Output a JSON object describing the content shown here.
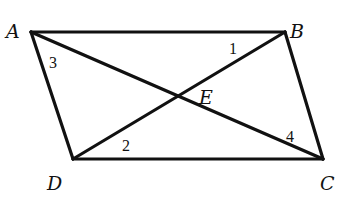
{
  "diagram": {
    "type": "parallelogram-with-diagonals",
    "stroke_color": "#111111",
    "background": "#ffffff",
    "vertices": {
      "A": {
        "label": "A",
        "x": 31,
        "y": 32,
        "label_x": 6,
        "label_y": 38
      },
      "B": {
        "label": "B",
        "x": 285,
        "y": 32,
        "label_x": 290,
        "label_y": 38
      },
      "C": {
        "label": "C",
        "x": 323,
        "y": 159,
        "label_x": 320,
        "label_y": 190
      },
      "D": {
        "label": "D",
        "x": 73,
        "y": 159,
        "label_x": 47,
        "label_y": 190
      },
      "E": {
        "label": "E",
        "x": 179,
        "y": 97,
        "label_x": 199,
        "label_y": 104
      }
    },
    "angle_labels": [
      {
        "label": "1",
        "x": 229,
        "y": 54
      },
      {
        "label": "2",
        "x": 122,
        "y": 151
      },
      {
        "label": "3",
        "x": 49,
        "y": 68
      },
      {
        "label": "4",
        "x": 286,
        "y": 142
      }
    ],
    "segments": [
      {
        "name": "AB",
        "from": "A",
        "to": "B"
      },
      {
        "name": "BC",
        "from": "B",
        "to": "C"
      },
      {
        "name": "CD",
        "from": "C",
        "to": "D"
      },
      {
        "name": "DA",
        "from": "D",
        "to": "A"
      },
      {
        "name": "AC",
        "from": "A",
        "to": "C"
      },
      {
        "name": "BD",
        "from": "B",
        "to": "D"
      }
    ]
  }
}
